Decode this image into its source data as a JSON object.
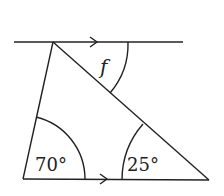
{
  "diagram": {
    "labels": {
      "angle_f": "f",
      "angle_left": "70°",
      "angle_right": "25°"
    },
    "stroke_color": "#222222"
  }
}
